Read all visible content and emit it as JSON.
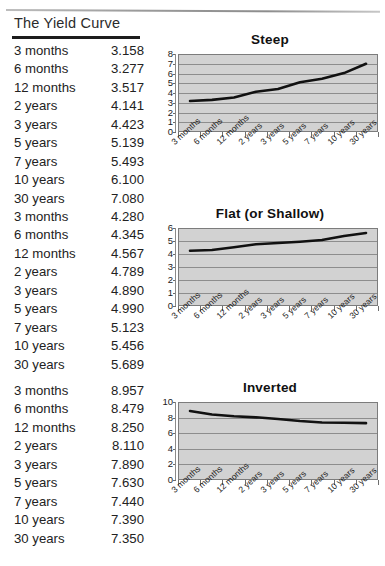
{
  "header": {
    "title": "The Yield Curve"
  },
  "maturities": [
    "3 months",
    "6 months",
    "12 months",
    "2 years",
    "3 years",
    "5 years",
    "7 years",
    "10 years",
    "30 years"
  ],
  "sections": [
    {
      "name": "steep",
      "chart_title": "Steep",
      "table": [
        {
          "label": "3 months",
          "value": "3.158"
        },
        {
          "label": "6 months",
          "value": "3.277"
        },
        {
          "label": "12 months",
          "value": "3.517"
        },
        {
          "label": "2 years",
          "value": "4.141"
        },
        {
          "label": "3 years",
          "value": "4.423"
        },
        {
          "label": "5 years",
          "value": "5.139"
        },
        {
          "label": "7 years",
          "value": "5.493"
        },
        {
          "label": "10 years",
          "value": "6.100"
        },
        {
          "label": "30 years",
          "value": "7.080"
        }
      ]
    },
    {
      "name": "flat",
      "chart_title": "Flat (or Shallow)",
      "table": [
        {
          "label": "3 months",
          "value": "4.280"
        },
        {
          "label": "6 months",
          "value": "4.345"
        },
        {
          "label": "12 months",
          "value": "4.567"
        },
        {
          "label": "2 years",
          "value": "4.789"
        },
        {
          "label": "3 years",
          "value": "4.890"
        },
        {
          "label": "5 years",
          "value": "4.990"
        },
        {
          "label": "7 years",
          "value": "5.123"
        },
        {
          "label": "10 years",
          "value": "5.456"
        },
        {
          "label": "30 years",
          "value": "5.689"
        }
      ]
    },
    {
      "name": "inverted",
      "chart_title": "Inverted",
      "table": [
        {
          "label": "3 months",
          "value": "8.957"
        },
        {
          "label": "6 months",
          "value": "8.479"
        },
        {
          "label": "12 months",
          "value": "8.250"
        },
        {
          "label": "2 years",
          "value": "8.110"
        },
        {
          "label": "3 years",
          "value": "7.890"
        },
        {
          "label": "5 years",
          "value": "7.630"
        },
        {
          "label": "7 years",
          "value": "7.440"
        },
        {
          "label": "10 years",
          "value": "7.390"
        },
        {
          "label": "30 years",
          "value": "7.350"
        }
      ]
    }
  ],
  "chart_data": [
    {
      "type": "line",
      "title": "Steep",
      "xlabel": "",
      "ylabel": "",
      "categories": [
        "3 months",
        "6 months",
        "12 months",
        "2 years",
        "3 years",
        "5 years",
        "7 years",
        "10 years",
        "30 years"
      ],
      "values": [
        3.158,
        3.277,
        3.517,
        4.141,
        4.423,
        5.139,
        5.493,
        6.1,
        7.08
      ],
      "ylim": [
        0,
        8
      ],
      "yticks": [
        0,
        1,
        2,
        3,
        4,
        5,
        6,
        7,
        8
      ],
      "grid": true,
      "legend": "none",
      "line_color": "#111111",
      "plot_bg": "#d2d2d2"
    },
    {
      "type": "line",
      "title": "Flat (or Shallow)",
      "xlabel": "",
      "ylabel": "",
      "categories": [
        "3 months",
        "6 months",
        "12 months",
        "2 years",
        "3 years",
        "5 years",
        "7 years",
        "10 years",
        "30 years"
      ],
      "values": [
        4.28,
        4.345,
        4.567,
        4.789,
        4.89,
        4.99,
        5.123,
        5.456,
        5.689
      ],
      "ylim": [
        0,
        6
      ],
      "yticks": [
        0,
        1,
        2,
        3,
        4,
        5,
        6
      ],
      "grid": true,
      "legend": "none",
      "line_color": "#111111",
      "plot_bg": "#d2d2d2"
    },
    {
      "type": "line",
      "title": "Inverted",
      "xlabel": "",
      "ylabel": "",
      "categories": [
        "3 months",
        "6 months",
        "12 months",
        "2 years",
        "3 years",
        "5 years",
        "7 years",
        "10 years",
        "30 years"
      ],
      "values": [
        8.957,
        8.479,
        8.25,
        8.11,
        7.89,
        7.63,
        7.44,
        7.39,
        7.35
      ],
      "ylim": [
        0,
        10
      ],
      "yticks": [
        0,
        2,
        4,
        6,
        8,
        10
      ],
      "grid": true,
      "legend": "none",
      "line_color": "#111111",
      "plot_bg": "#d2d2d2"
    }
  ]
}
